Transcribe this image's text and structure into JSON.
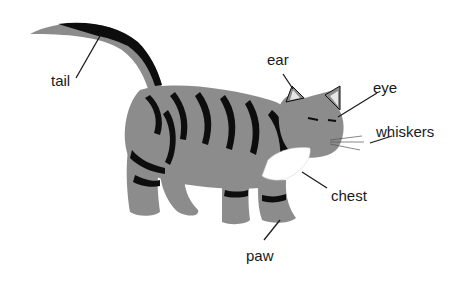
{
  "diagram": {
    "colors": {
      "fur": "#8c8c8c",
      "stripes": "#0d0d0d",
      "chest": "#ffffff",
      "lines": "#1a1a1a"
    },
    "labels": [
      {
        "id": "tail",
        "text": "tail"
      },
      {
        "id": "ear",
        "text": "ear"
      },
      {
        "id": "eye",
        "text": "eye"
      },
      {
        "id": "whiskers",
        "text": "whiskers"
      },
      {
        "id": "chest",
        "text": "chest"
      },
      {
        "id": "paw",
        "text": "paw"
      }
    ]
  }
}
